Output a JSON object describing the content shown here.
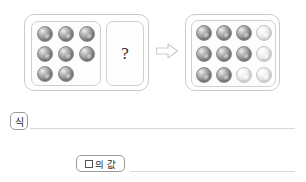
{
  "problem": {
    "type": "marble-equation-worksheet",
    "left_group": {
      "label": "known-marbles-box",
      "rows": [
        3,
        3,
        2
      ],
      "marble_count": 8,
      "marble_color": "dark-gray",
      "colors": {
        "dark": "#8e8e8e",
        "light": "#e4e4e4"
      }
    },
    "unknown_box": {
      "label": "unknown-quantity-box",
      "symbol": "?"
    },
    "arrow": {
      "name": "right-arrow-icon",
      "direction": "right",
      "color": "#cfcfcf"
    },
    "right_group": {
      "label": "total-marbles-box",
      "columns": 4,
      "rows": 3,
      "total": 12,
      "dark_count": 8,
      "light_count": 4,
      "grid": [
        [
          "dark",
          "dark",
          "dark",
          "light"
        ],
        [
          "dark",
          "dark",
          "dark",
          "light"
        ],
        [
          "dark",
          "dark",
          "light",
          "light"
        ]
      ]
    }
  },
  "answers": {
    "equation_label": "식",
    "equation_value": "",
    "box_value_label": "의 값",
    "box_value_symbol": "□",
    "box_value": ""
  }
}
